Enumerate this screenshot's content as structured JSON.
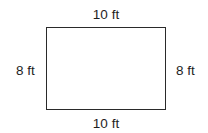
{
  "diagram": {
    "shape": "rectangle",
    "colors": {
      "stroke": "#2a2a2a",
      "text": "#1e1e1e",
      "background": "#ffffff"
    },
    "labels": {
      "top": "10 ft",
      "bottom": "10 ft",
      "left": "8 ft",
      "right": "8 ft"
    }
  }
}
